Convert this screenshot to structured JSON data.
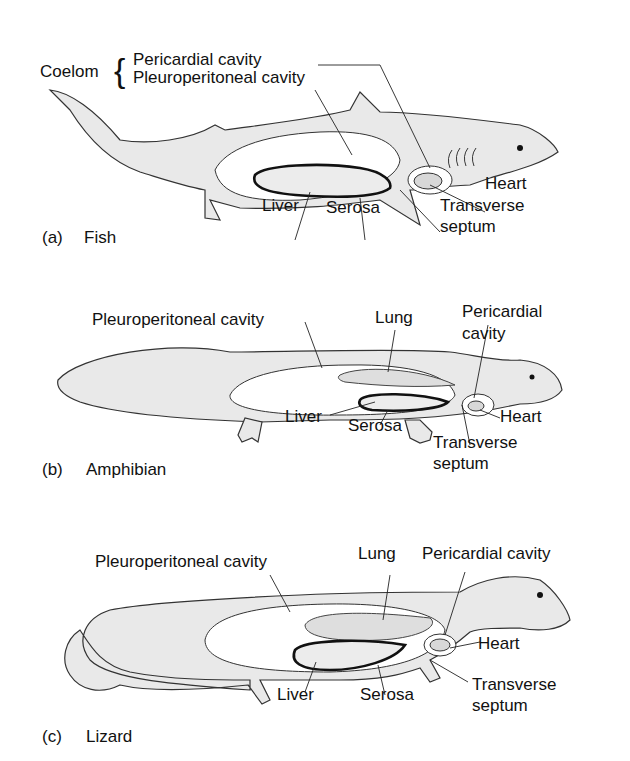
{
  "figure": {
    "panels": [
      {
        "id": "a",
        "caption_letter": "(a)",
        "caption_name": "Fish",
        "coelom_label": "Coelom",
        "labels": {
          "pericardial": "Pericardial cavity",
          "pleuroperitoneal": "Pleuroperitoneal cavity",
          "liver": "Liver",
          "serosa": "Serosa",
          "heart": "Heart",
          "transverse_1": "Transverse",
          "transverse_2": "septum"
        }
      },
      {
        "id": "b",
        "caption_letter": "(b)",
        "caption_name": "Amphibian",
        "labels": {
          "pleuroperitoneal": "Pleuroperitoneal cavity",
          "lung": "Lung",
          "pericardial_1": "Pericardial",
          "pericardial_2": "cavity",
          "liver": "Liver",
          "serosa": "Serosa",
          "heart": "Heart",
          "transverse_1": "Transverse",
          "transverse_2": "septum"
        }
      },
      {
        "id": "c",
        "caption_letter": "(c)",
        "caption_name": "Lizard",
        "labels": {
          "pleuroperitoneal": "Pleuroperitoneal cavity",
          "lung": "Lung",
          "pericardial": "Pericardial cavity",
          "liver": "Liver",
          "serosa": "Serosa",
          "heart": "Heart",
          "transverse_1": "Transverse",
          "transverse_2": "septum"
        }
      }
    ]
  }
}
